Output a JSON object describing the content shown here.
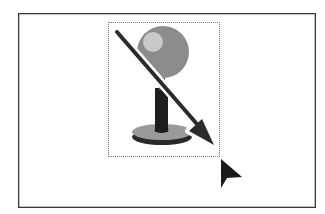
{
  "canvas": {
    "description": "Drawing canvas with a pushpin graphic inside a dotted selection box, a diagonal drag arrow, and a mouse pointer",
    "colors": {
      "frame": "#3a3a3a",
      "pin_head": "#8c8c8c",
      "pin_highlight": "#c8c8c8",
      "pin_shaft": "#1e1e1e",
      "pin_base": "#9a9a9a",
      "pin_base_shadow": "#2a2a2a",
      "arrow": "#2b2b2b",
      "cursor": "#1a1a1a",
      "selection_border": "#777777"
    }
  },
  "graphic": {
    "icon": "pushpin-icon"
  },
  "drag_indicator": {
    "icon": "arrow-down-right-icon"
  },
  "pointer": {
    "icon": "mouse-pointer-icon"
  }
}
